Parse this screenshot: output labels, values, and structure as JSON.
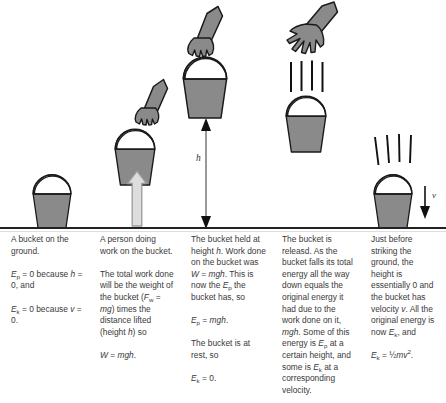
{
  "diagram": {
    "colors": {
      "bucket_fill": "#8a8a8a",
      "outline": "#1a1a1a",
      "arrow_light_fill": "#d8d8d8",
      "arrow_light_stroke": "#9a9a9a",
      "ground_line": "#222222",
      "separator_line": "#7a7a7a",
      "text": "#3a3a3a",
      "background": "#ffffff"
    },
    "labels": {
      "height_arrow": "h",
      "velocity_arrow": "v"
    },
    "panels": [
      {
        "name": "bucket-on-ground",
        "icons": [
          "bucket-icon"
        ]
      },
      {
        "name": "person-lifting-bucket",
        "icons": [
          "bucket-icon",
          "hand-gripping-icon",
          "arm-icon",
          "up-arrow-icon"
        ]
      },
      {
        "name": "bucket-held-at-height",
        "icons": [
          "bucket-icon",
          "hand-gripping-icon",
          "arm-icon",
          "height-arrow-icon"
        ]
      },
      {
        "name": "bucket-released-falling",
        "icons": [
          "open-hand-icon",
          "arm-icon",
          "motion-lines-icon",
          "bucket-icon"
        ]
      },
      {
        "name": "bucket-striking-ground",
        "icons": [
          "motion-lines-icon",
          "bucket-icon",
          "velocity-arrow-icon"
        ]
      }
    ]
  },
  "columns": [
    {
      "id": "column-bucket-on-ground",
      "paragraphs": [
        {
          "id": "p1",
          "html": "A bucket on the ground."
        },
        {
          "id": "p2",
          "html": "<i>E</i><sub>p</sub> = 0 because <i>h</i> = 0, and"
        },
        {
          "id": "p3",
          "html": "<i>E</i><sub>k</sub> = 0 because <i>v</i> = 0."
        }
      ],
      "plain": [
        "A bucket on the ground.",
        "Ep = 0 because h = 0, and",
        "Ek = 0 because v = 0."
      ]
    },
    {
      "id": "column-person-doing-work",
      "paragraphs": [
        {
          "id": "p1",
          "html": "A person doing work on the bucket."
        },
        {
          "id": "p2",
          "html": "The total work done will be the weight of the bucket (<i>F</i><sub>w</sub> = <i>mg</i>) times the distance lifted (height <i>h</i>) so"
        },
        {
          "id": "p3",
          "html": "<i>W</i> = <i>mgh</i>."
        }
      ],
      "plain": [
        "A person doing work on the bucket.",
        "The total work done will be the weight of the bucket (Fw = mg) times the distance lifted (height h) so",
        "W = mgh."
      ]
    },
    {
      "id": "column-bucket-held-at-height",
      "paragraphs": [
        {
          "id": "p1",
          "html": "The bucket held at height <i>h</i>. Work done on the bucket was <i>W</i> = <i>mgh</i>. This is now the <i>E</i><sub>p</sub> the bucket has, so"
        },
        {
          "id": "p2",
          "html": "<i>E</i><sub>p</sub> = <i>mgh</i>."
        },
        {
          "id": "p3",
          "html": "The bucket is at rest, so"
        },
        {
          "id": "p4",
          "html": "<i>E</i><sub>k</sub> = 0."
        }
      ],
      "plain": [
        "The bucket held at height h. Work done on the bucket was W = mgh. This is now the Ep the bucket has, so",
        "Ep = mgh.",
        "The bucket is at rest, so",
        "Ek = 0."
      ]
    },
    {
      "id": "column-bucket-released",
      "paragraphs": [
        {
          "id": "p1",
          "html": "The bucket is releasd. As the bucket falls its total energy all the way down equals the original energy it had due to the work done on it, <i>mgh</i>. Some of this energy is <i>E</i><sub>p</sub> at a certain height, and some is <i>E</i><sub>k</sub> at a corresponding velocity."
        }
      ],
      "plain": [
        "The bucket is releasd. As the bucket falls its total energy all the way down equals the original energy it had due to the work done on it, mgh. Some of this energy is Ep at a certain height, and some is Ek at a corresponding velocity."
      ]
    },
    {
      "id": "column-just-before-striking",
      "paragraphs": [
        {
          "id": "p1",
          "html": "Just before striking the ground, the height is essentially 0 and the bucket has velocity <i>v</i>. All the original energy is now <i>E</i><sub>k</sub>, and"
        },
        {
          "id": "p2",
          "html": "<i>E</i><sub>k</sub> = ½<i>mv</i><sup>2</sup>."
        }
      ],
      "plain": [
        "Just before striking the ground, the height is essentially 0 and the bucket has velocity v. All the original energy is now Ek, and",
        "Ek = ½mv2."
      ]
    }
  ]
}
